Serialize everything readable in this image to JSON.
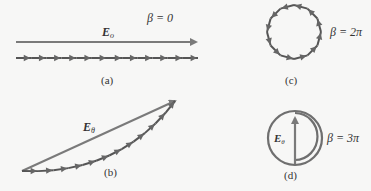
{
  "diagram": {
    "colors": {
      "resultant": "#7a7a7a",
      "phasor_chain": "#5a5a5a",
      "arrowheads": "#6a6a6a",
      "text": "#333333",
      "background": "#f7f7f6"
    },
    "panels": [
      {
        "id": "a",
        "caption": "(a)",
        "beta_label": "β = 0",
        "resultant_label": "E",
        "resultant_subscript": "o",
        "phasor_count": 12,
        "shape": "straight line"
      },
      {
        "id": "b",
        "caption": "(b)",
        "beta_label": "",
        "resultant_label": "E",
        "resultant_subscript": "θ",
        "phasor_count": 12,
        "shape": "arc"
      },
      {
        "id": "c",
        "caption": "(c)",
        "beta_label": "β = 2π",
        "resultant_label": "",
        "resultant_subscript": "",
        "phasor_count": 12,
        "shape": "full circle"
      },
      {
        "id": "d",
        "caption": "(d)",
        "beta_label": "β = 3π",
        "resultant_label": "E",
        "resultant_subscript": "θ",
        "phasor_count": 0,
        "shape": "one and a half circles"
      }
    ]
  }
}
